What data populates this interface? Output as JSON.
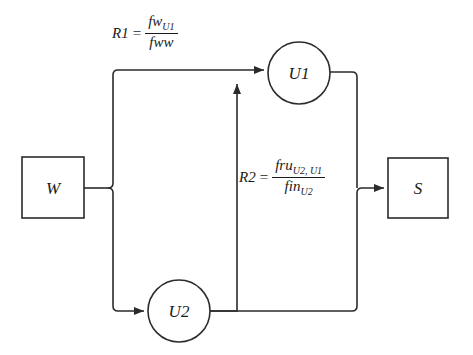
{
  "diagram": {
    "stroke_color": "#2b2b2b",
    "background_color": "#ffffff",
    "nodes": [
      {
        "id": "W",
        "shape": "rectangle",
        "label": "W"
      },
      {
        "id": "U1",
        "shape": "circle",
        "label": "U1"
      },
      {
        "id": "U2",
        "shape": "circle",
        "label": "U2"
      },
      {
        "id": "S",
        "shape": "rectangle",
        "label": "S"
      }
    ],
    "formulas": [
      {
        "id": "R1",
        "lhs": "R1",
        "equals": "=",
        "numerator": "fw",
        "numerator_sub": "U1",
        "denominator": "fww",
        "denominator_sub": ""
      },
      {
        "id": "R2",
        "lhs": "R2",
        "equals": "=",
        "numerator": "fru",
        "numerator_sub": "U2, U1",
        "denominator": "fin",
        "denominator_sub": "U2"
      }
    ],
    "edges": [
      {
        "from": "W",
        "to": "U1",
        "label_id": "R1"
      },
      {
        "from": "W",
        "to": "U2",
        "label_id": ""
      },
      {
        "from": "U2",
        "to": "U1",
        "label_id": ""
      },
      {
        "from": "U1",
        "to": "S",
        "label_id": ""
      },
      {
        "from": "U2",
        "to": "S",
        "label_id": "R2"
      }
    ]
  }
}
